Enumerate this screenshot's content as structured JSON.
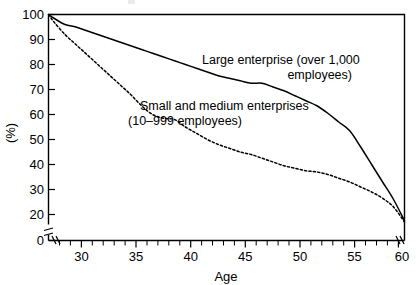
{
  "chart_data": {
    "type": "line",
    "title": "",
    "xlabel": "Age",
    "ylabel": "(%)",
    "xlim": [
      27.5,
      60
    ],
    "ylim": [
      15,
      100
    ],
    "y_axis_break": true,
    "y_break_between": [
      0,
      20
    ],
    "x_axis_break": true,
    "grid": false,
    "legend_position": "inline-annotations",
    "x_ticks": [
      30,
      35,
      40,
      45,
      50,
      55,
      60
    ],
    "x_tick_labels": [
      "30",
      "35",
      "40",
      "45",
      "50",
      "55",
      "60"
    ],
    "x_minor_tick_interval": 1,
    "y_ticks": [
      0,
      20,
      30,
      40,
      50,
      60,
      70,
      80,
      90,
      100
    ],
    "y_tick_labels": [
      "0",
      "20",
      "30",
      "40",
      "50",
      "60",
      "70",
      "80",
      "90",
      "100"
    ],
    "series": [
      {
        "name": "Large enterprise (over 1,000 employees)",
        "style": "solid",
        "color": "#000000",
        "x": [
          27.5,
          28,
          29,
          30,
          31,
          32,
          33,
          34,
          35,
          36,
          37,
          38,
          39,
          40,
          41,
          42,
          43,
          44,
          45,
          46,
          47,
          48,
          49,
          50,
          51,
          52,
          53,
          54,
          55,
          56,
          57,
          58,
          59,
          60
        ],
        "y": [
          100,
          98.5,
          96,
          95,
          93.5,
          92,
          90.5,
          89,
          87.5,
          86,
          84.5,
          83,
          81.5,
          80,
          78.5,
          77,
          75.5,
          74.5,
          73.5,
          72.5,
          72.5,
          71,
          69.5,
          67.5,
          65.5,
          63.5,
          60.5,
          57,
          53.5,
          47,
          40,
          33,
          26,
          17.5
        ]
      },
      {
        "name": "Small and medium enterprises (10–999 employees)",
        "style": "dashed",
        "color": "#000000",
        "x": [
          27.5,
          28,
          29,
          30,
          31,
          32,
          33,
          34,
          35,
          36,
          37,
          38,
          39,
          40,
          41,
          42,
          43,
          44,
          45,
          46,
          47,
          48,
          49,
          50,
          51,
          52,
          53,
          54,
          55,
          56,
          57,
          58,
          59,
          60
        ],
        "y": [
          100,
          97,
          92,
          88,
          84,
          80,
          76,
          72,
          68,
          63.5,
          60,
          58.5,
          58,
          55,
          52.5,
          50,
          48,
          46.5,
          45,
          44,
          42.5,
          41,
          39.5,
          38.5,
          37.5,
          37,
          36,
          34.5,
          33,
          31,
          29,
          26.5,
          23,
          17
        ]
      }
    ],
    "annotations": [
      {
        "name": "large-enterprise-label",
        "lines": [
          "Large enterprise (over 1,000",
          "employees)"
        ],
        "align": [
          "left",
          "right"
        ]
      },
      {
        "name": "sme-label",
        "lines": [
          "Small and medium enterprises",
          "(10–999 employees)"
        ],
        "align": [
          "left",
          "center"
        ]
      }
    ]
  }
}
